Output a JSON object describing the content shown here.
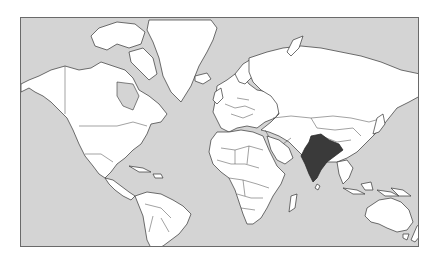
{
  "map": {
    "title": "World map with India highlighted",
    "projection": "mercator",
    "highlighted_country": "India",
    "colors": {
      "ocean": "#d4d4d4",
      "land": "#ffffff",
      "highlight": "#3a3a3a",
      "border": "#333333",
      "frame": "#6a6a6a"
    },
    "regions": [
      "North America",
      "Greenland",
      "South America",
      "Europe",
      "Africa",
      "Asia",
      "Australia",
      "New Zealand"
    ]
  }
}
